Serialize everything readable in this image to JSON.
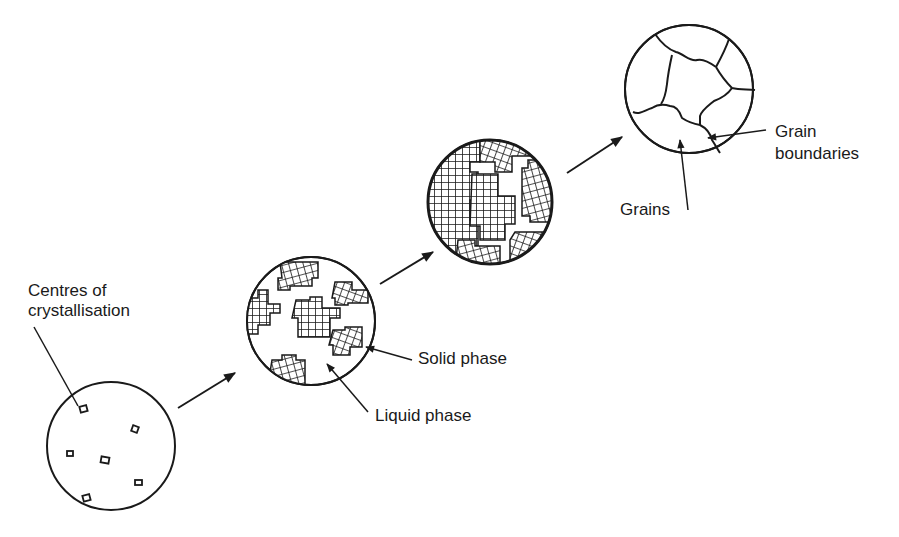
{
  "diagram": {
    "title": "",
    "stages": [
      {
        "id": "nucleation",
        "description": "Liquid with centres of crystallisation"
      },
      {
        "id": "growth",
        "description": "Crystals growing in liquid"
      },
      {
        "id": "impingement",
        "description": "Crystals meeting, little liquid remaining"
      },
      {
        "id": "solid",
        "description": "Fully solid polycrystalline grains"
      }
    ],
    "labels": {
      "centres_line1": "Centres of",
      "centres_line2": "crystallisation",
      "solid_phase": "Solid phase",
      "liquid_phase": "Liquid phase",
      "grains": "Grains",
      "grain_line1": "Grain",
      "grain_line2": "boundaries"
    },
    "colors": {
      "ink": "#1a1a1a",
      "background": "#ffffff"
    }
  }
}
